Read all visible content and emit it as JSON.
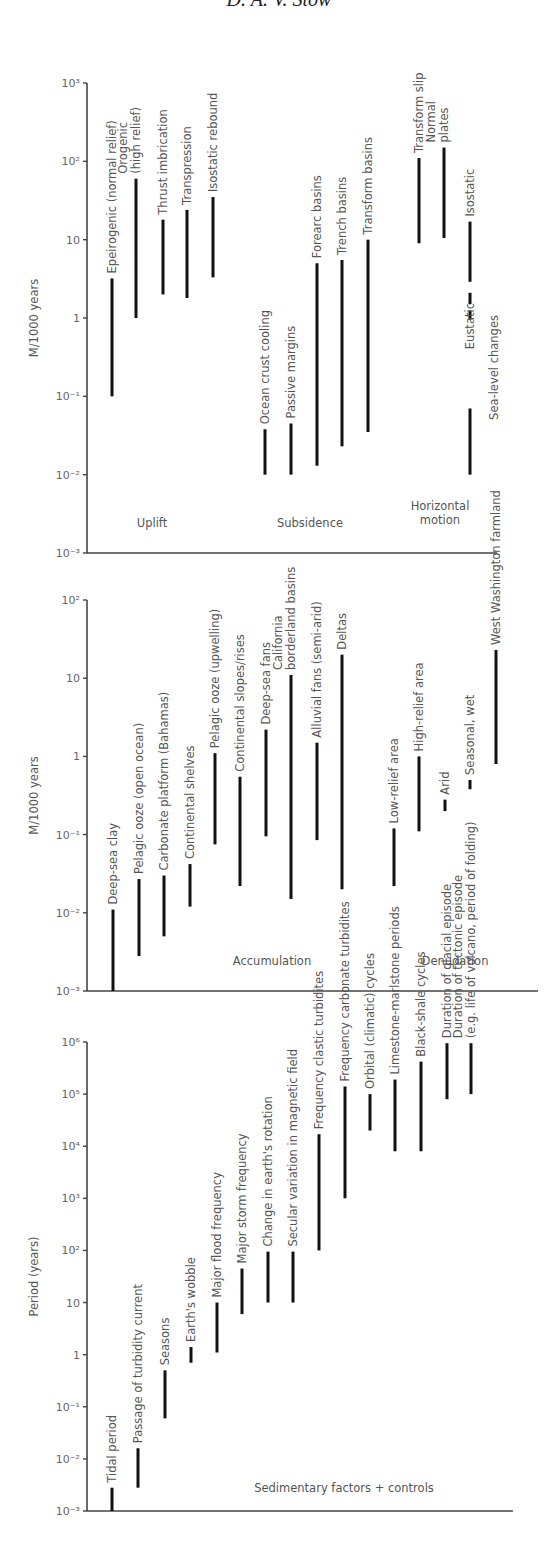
{
  "header": {
    "author": "D. A. V. Stow"
  },
  "chart_data": [
    {
      "type": "range-bar",
      "title": "Uplift, subsidence and horizontal motion rates",
      "ylabel": "M/1000 years",
      "yscale": "log",
      "ylim": [
        0.001,
        1000
      ],
      "yticks": [
        {
          "v": 1000,
          "label": "10³"
        },
        {
          "v": 100,
          "label": "10²"
        },
        {
          "v": 10,
          "label": "10"
        },
        {
          "v": 1,
          "label": "1"
        },
        {
          "v": 0.1,
          "label": "10⁻¹"
        },
        {
          "v": 0.01,
          "label": "10⁻²"
        },
        {
          "v": 0.001,
          "label": "10⁻³"
        }
      ],
      "groups": [
        {
          "label": "Uplift",
          "x": 152,
          "y": 527
        },
        {
          "label": "Subsidence",
          "x": 310,
          "y": 527
        },
        {
          "label": "Horizontal motion",
          "lines": [
            "Horizontal",
            "motion"
          ],
          "x": 440,
          "y": 510
        }
      ],
      "series": [
        {
          "name": "Epeirogenic (normal relief)",
          "lines": [
            "Epeirogenic (normal relief)"
          ],
          "x": 112,
          "min": 0.1,
          "max": 3.2
        },
        {
          "name": "Orogenic (high relief)",
          "lines": [
            "Orogenic",
            "(high relief)"
          ],
          "x": 136,
          "min": 1,
          "max": 60
        },
        {
          "name": "Thrust imbrication",
          "lines": [
            "Thrust imbrication"
          ],
          "x": 163,
          "min": 2,
          "max": 18
        },
        {
          "name": "Transpression",
          "lines": [
            "Transpression"
          ],
          "x": 187,
          "min": 1.8,
          "max": 24
        },
        {
          "name": "Isostatic rebound",
          "lines": [
            "Isostatic rebound"
          ],
          "x": 213,
          "min": 3.3,
          "max": 35
        },
        {
          "name": "Ocean crust cooling",
          "lines": [
            "Ocean crust cooling"
          ],
          "x": 265,
          "min": 0.01,
          "max": 0.038
        },
        {
          "name": "Passive margins",
          "lines": [
            "Passive margins"
          ],
          "x": 291,
          "min": 0.01,
          "max": 0.045
        },
        {
          "name": "Forearc basins",
          "lines": [
            "Forearc basins"
          ],
          "x": 317,
          "min": 0.013,
          "max": 5
        },
        {
          "name": "Trench basins",
          "lines": [
            "Trench basins"
          ],
          "x": 342,
          "min": 0.023,
          "max": 5.5
        },
        {
          "name": "Transform basins",
          "lines": [
            "Transform basins"
          ],
          "x": 368,
          "min": 0.035,
          "max": 10
        },
        {
          "name": "Transform slip",
          "lines": [
            "Transform slip"
          ],
          "x": 419,
          "min": 9,
          "max": 110
        },
        {
          "name": "Normal plates",
          "lines": [
            "Normal",
            "plates"
          ],
          "x": 444,
          "min": 10.5,
          "max": 150
        },
        {
          "name": "Isostatic (sea-level changes)",
          "lines": [
            "Isostatic"
          ],
          "x": 470,
          "min": 2.9,
          "max": 17,
          "dashes": [
            [
              1.5,
              2.1
            ],
            [
              0.95,
              1.25
            ]
          ]
        },
        {
          "name": "Eustatic (sea-level changes)",
          "lines": [
            "Eustatic"
          ],
          "x": 470,
          "min": 0.01,
          "max": 0.07,
          "label_y": 0.4
        },
        {
          "name": "Sea-level changes",
          "lines": [
            "Sea-level changes"
          ],
          "x": 494,
          "min": null,
          "max": null,
          "label_y": 0.05,
          "label_only": true
        }
      ],
      "frame": {
        "x0": 87,
        "x1": 497,
        "ytop": 83,
        "ybot": 553
      }
    },
    {
      "type": "range-bar",
      "title": "Accumulation and denudation rates",
      "ylabel": "M/1000 years",
      "yscale": "log",
      "ylim": [
        0.001,
        100
      ],
      "yticks": [
        {
          "v": 100,
          "label": "10²"
        },
        {
          "v": 10,
          "label": "10"
        },
        {
          "v": 1,
          "label": "1"
        },
        {
          "v": 0.1,
          "label": "10⁻¹"
        },
        {
          "v": 0.01,
          "label": "10⁻²"
        },
        {
          "v": 0.001,
          "label": "10⁻³"
        }
      ],
      "groups": [
        {
          "label": "Accumulation",
          "x": 272,
          "y": 965
        },
        {
          "label": "Denudation",
          "x": 455,
          "y": 965
        }
      ],
      "series": [
        {
          "name": "Deep-sea clay",
          "lines": [
            "Deep-sea clay"
          ],
          "x": 113,
          "min": 0.001,
          "max": 0.011
        },
        {
          "name": "Pelagic ooze (open ocean)",
          "lines": [
            "Pelagic ooze (open ocean)"
          ],
          "x": 139,
          "min": 0.0028,
          "max": 0.027
        },
        {
          "name": "Carbonate platform (Bahamas)",
          "lines": [
            "Carbonate platform (Bahamas)"
          ],
          "x": 164,
          "min": 0.005,
          "max": 0.03
        },
        {
          "name": "Continental shelves",
          "lines": [
            "Continental shelves"
          ],
          "x": 190,
          "min": 0.012,
          "max": 0.042
        },
        {
          "name": "Pelagic ooze (upwelling)",
          "lines": [
            "Pelagic ooze (upwelling)"
          ],
          "x": 215,
          "min": 0.075,
          "max": 1.1
        },
        {
          "name": "Continental slopes/rises",
          "lines": [
            "Continental slopes/rises"
          ],
          "x": 240,
          "min": 0.022,
          "max": 0.55
        },
        {
          "name": "Deep-sea fans",
          "lines": [
            "Deep-sea fans"
          ],
          "x": 266,
          "min": 0.095,
          "max": 2.2
        },
        {
          "name": "California borderland basins",
          "lines": [
            "California",
            "borderland basins"
          ],
          "x": 291,
          "min": 0.015,
          "max": 11
        },
        {
          "name": "Alluvial fans (semi-arid)",
          "lines": [
            "Alluvial fans (semi-arid)"
          ],
          "x": 317,
          "min": 0.085,
          "max": 1.5
        },
        {
          "name": "Deltas",
          "lines": [
            "Deltas"
          ],
          "x": 342,
          "min": 0.02,
          "max": 20
        },
        {
          "name": "Low-relief area",
          "lines": [
            "Low-relief area"
          ],
          "x": 394,
          "min": 0.022,
          "max": 0.12
        },
        {
          "name": "High-relief area",
          "lines": [
            "High-relief area"
          ],
          "x": 419,
          "min": 0.11,
          "max": 1
        },
        {
          "name": "Arid",
          "lines": [
            "Arid"
          ],
          "x": 445,
          "min": 0.2,
          "max": 0.28
        },
        {
          "name": "Seasonal, wet",
          "lines": [
            "Seasonal, wet"
          ],
          "x": 470,
          "min": 0.38,
          "max": 0.5
        },
        {
          "name": "West Washington farmland",
          "lines": [
            "West Washington farmland"
          ],
          "x": 496,
          "min": 0.8,
          "max": 23
        }
      ],
      "frame": {
        "x0": 87,
        "x1": 538,
        "ytop": 600,
        "ybot": 991
      }
    },
    {
      "type": "range-bar",
      "title": "Sedimentary factors + controls",
      "ylabel": "Period (years)",
      "yscale": "log",
      "ylim": [
        0.001,
        1000000
      ],
      "yticks": [
        {
          "v": 1000000,
          "label": "10⁶"
        },
        {
          "v": 100000,
          "label": "10⁵"
        },
        {
          "v": 10000,
          "label": "10⁴"
        },
        {
          "v": 1000,
          "label": "10³"
        },
        {
          "v": 100,
          "label": "10²"
        },
        {
          "v": 10,
          "label": "10"
        },
        {
          "v": 1,
          "label": "1"
        },
        {
          "v": 0.1,
          "label": "10⁻¹"
        },
        {
          "v": 0.01,
          "label": "10⁻²"
        },
        {
          "v": 0.001,
          "label": "10⁻³"
        }
      ],
      "groups": [
        {
          "label": "Sedimentary factors + controls",
          "x": 344,
          "y": 1492
        }
      ],
      "series": [
        {
          "name": "Tidal period",
          "lines": [
            "Tidal period"
          ],
          "x": 112,
          "min": 0.001,
          "max": 0.0028
        },
        {
          "name": "Passage of turbidity current",
          "lines": [
            "Passage of turbidity current"
          ],
          "x": 138,
          "min": 0.0028,
          "max": 0.016
        },
        {
          "name": "Seasons",
          "lines": [
            "Seasons"
          ],
          "x": 165,
          "min": 0.06,
          "max": 0.5
        },
        {
          "name": "Earth's wobble",
          "lines": [
            "Earth's wobble"
          ],
          "x": 191,
          "min": 0.7,
          "max": 1.4
        },
        {
          "name": "Major flood frequency",
          "lines": [
            "Major flood frequency"
          ],
          "x": 217,
          "min": 1.1,
          "max": 10
        },
        {
          "name": "Major storm frequency",
          "lines": [
            "Major storm frequency"
          ],
          "x": 242,
          "min": 6,
          "max": 45
        },
        {
          "name": "Change in earth's rotation",
          "lines": [
            "Change in earth's rotation"
          ],
          "x": 268,
          "min": 10,
          "max": 95
        },
        {
          "name": "Secular variation in magnetic field",
          "lines": [
            "Secular variation in magnetic field"
          ],
          "x": 293,
          "min": 10,
          "max": 95
        },
        {
          "name": "Frequency clastic turbidites",
          "lines": [
            "Frequency clastic turbidites"
          ],
          "x": 319,
          "min": 100,
          "max": 17000
        },
        {
          "name": "Frequency carbonate turbidites",
          "lines": [
            "Frequency carbonate turbidites"
          ],
          "x": 345,
          "min": 1000,
          "max": 140000
        },
        {
          "name": "Orbital (climatic) cycles",
          "lines": [
            "Orbital (climatic) cycles"
          ],
          "x": 370,
          "min": 20000,
          "max": 100000
        },
        {
          "name": "Limestone-marlstone periods",
          "lines": [
            "Limestone-marlstone periods"
          ],
          "x": 395,
          "min": 8000,
          "max": 190000
        },
        {
          "name": "Black-shale cycles",
          "lines": [
            "Black-shale cycles"
          ],
          "x": 421,
          "min": 8000,
          "max": 420000
        },
        {
          "name": "Duration of glacial episode",
          "lines": [
            "Duration of glacial episode"
          ],
          "x": 447,
          "min": 80000,
          "max": 950000
        },
        {
          "name": "Duration of tectonic episode (e.g. life of volcano, period of folding)",
          "lines": [
            "Duration of tectonic episode",
            "(e.g. life of volcano, period of folding)"
          ],
          "x": 471,
          "min": 100000,
          "max": 950000
        }
      ],
      "frame": {
        "x0": 87,
        "x1": 513,
        "ytop": 1042,
        "ybot": 1511
      }
    }
  ]
}
